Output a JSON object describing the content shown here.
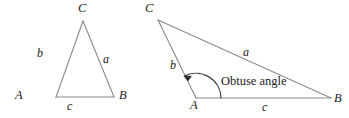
{
  "figure": {
    "background_color": "#ffffff",
    "stroke_color": "#8a8a8a",
    "text_color": "#1a1a1a",
    "width": 349,
    "height": 118
  },
  "diagrams": [
    {
      "name": "acute-triangle",
      "vertices": [
        {
          "label": "A",
          "x": 56,
          "y": 97
        },
        {
          "label": "B",
          "x": 114,
          "y": 97
        },
        {
          "label": "C",
          "x": 83,
          "y": 21
        }
      ],
      "vertex_labels": [
        {
          "label": "A",
          "x": 15,
          "y": 92
        },
        {
          "label": "B",
          "x": 119,
          "y": 92
        },
        {
          "label": "C",
          "x": 78,
          "y": 2
        }
      ],
      "side_labels": [
        {
          "label": "b",
          "x": 37,
          "y": 47
        },
        {
          "label": "a",
          "x": 103,
          "y": 53
        },
        {
          "label": "c",
          "x": 67,
          "y": 100
        }
      ]
    },
    {
      "name": "obtuse-triangle",
      "vertices": [
        {
          "label": "A",
          "x": 196,
          "y": 98
        },
        {
          "label": "B",
          "x": 331,
          "y": 98
        },
        {
          "label": "C",
          "x": 158,
          "y": 20
        }
      ],
      "vertex_labels": [
        {
          "label": "A",
          "x": 190,
          "y": 99
        },
        {
          "label": "B",
          "x": 334,
          "y": 93
        },
        {
          "label": "C",
          "x": 145,
          "y": 2
        }
      ],
      "side_labels": [
        {
          "label": "b",
          "x": 170,
          "y": 59
        },
        {
          "label": "a",
          "x": 243,
          "y": 46
        },
        {
          "label": "c",
          "x": 262,
          "y": 101
        }
      ],
      "annotation": {
        "text": "Obtuse angle",
        "x": 221,
        "y": 75
      }
    }
  ]
}
